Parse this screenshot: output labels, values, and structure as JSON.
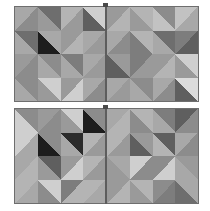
{
  "scene": {
    "title": "Geometric diagonal tile panels",
    "description": "Four square panels arranged two by two, each divided into a four by four grid of square tiles split along a diagonal into two grayscale triangles",
    "background_color": "#ffffff",
    "panel_border_color": "#6e6e6e",
    "seam_color": "#5d5d5d",
    "grid_rows": 4,
    "grid_cols": 4,
    "panel_count": 4
  },
  "palette": {
    "black": "#1d1d1d",
    "near_black": "#2b2b2b",
    "very_dark": "#4a4a4a",
    "dark": "#5f5f5f",
    "dark_mid": "#6e6e6e",
    "mid_dark": "#7d7d7d",
    "mid": "#8c8c8c",
    "mid_light": "#9a9a9a",
    "light_mid": "#a8a8a8",
    "light": "#b4b4b4",
    "lighter": "#c2c2c2",
    "pale": "#cfcfcf",
    "very_pale": "#dcdcdc",
    "near_white": "#e6e6e6"
  },
  "panels": [
    {
      "name": "top-left-panel",
      "position": "top-left",
      "x": 14,
      "y": 6,
      "w": 93,
      "h": 96,
      "tiles": [
        {
          "diagonal": "tlbr",
          "a": "#a8a8a8",
          "b": "#8c8c8c"
        },
        {
          "diagonal": "trbl",
          "a": "#6e6e6e",
          "b": "#9a9a9a"
        },
        {
          "diagonal": "tlbr",
          "a": "#b4b4b4",
          "b": "#9a9a9a"
        },
        {
          "diagonal": "trbl",
          "a": "#cfcfcf",
          "b": "#5f5f5f"
        },
        {
          "diagonal": "trbl",
          "a": "#6e6e6e",
          "b": "#a8a8a8"
        },
        {
          "diagonal": "trbl",
          "a": "#a8a8a8",
          "b": "#1d1d1d"
        },
        {
          "diagonal": "tlbr",
          "a": "#9a9a9a",
          "b": "#b4b4b4"
        },
        {
          "diagonal": "tlbr",
          "a": "#a8a8a8",
          "b": "#9a9a9a"
        },
        {
          "diagonal": "tlbr",
          "a": "#9a9a9a",
          "b": "#8c8c8c"
        },
        {
          "diagonal": "trbl",
          "a": "#8c8c8c",
          "b": "#a8a8a8"
        },
        {
          "diagonal": "trbl",
          "a": "#7d7d7d",
          "b": "#a8a8a8"
        },
        {
          "diagonal": "tlbr",
          "a": "#a8a8a8",
          "b": "#9a9a9a"
        },
        {
          "diagonal": "trbl",
          "a": "#8c8c8c",
          "b": "#a8a8a8"
        },
        {
          "diagonal": "trbl",
          "a": "#cfcfcf",
          "b": "#9a9a9a"
        },
        {
          "diagonal": "tlbr",
          "a": "#9a9a9a",
          "b": "#cfcfcf"
        },
        {
          "diagonal": "tlbr",
          "a": "#a8a8a8",
          "b": "#8c8c8c"
        }
      ]
    },
    {
      "name": "top-right-panel",
      "position": "top-right",
      "x": 106,
      "y": 6,
      "w": 93,
      "h": 96,
      "tiles": [
        {
          "diagonal": "tlbr",
          "a": "#9a9a9a",
          "b": "#b4b4b4"
        },
        {
          "diagonal": "trbl",
          "a": "#b4b4b4",
          "b": "#9a9a9a"
        },
        {
          "diagonal": "trbl",
          "a": "#8c8c8c",
          "b": "#c2c2c2"
        },
        {
          "diagonal": "tlbr",
          "a": "#c2c2c2",
          "b": "#a8a8a8"
        },
        {
          "diagonal": "tlbr",
          "a": "#a8a8a8",
          "b": "#8c8c8c"
        },
        {
          "diagonal": "trbl",
          "a": "#b4b4b4",
          "b": "#7d7d7d"
        },
        {
          "diagonal": "trbl",
          "a": "#6e6e6e",
          "b": "#a8a8a8"
        },
        {
          "diagonal": "tlbr",
          "a": "#7d7d7d",
          "b": "#5f5f5f"
        },
        {
          "diagonal": "trbl",
          "a": "#9a9a9a",
          "b": "#5f5f5f"
        },
        {
          "diagonal": "tlbr",
          "a": "#7d7d7d",
          "b": "#9a9a9a"
        },
        {
          "diagonal": "tlbr",
          "a": "#9a9a9a",
          "b": "#b4b4b4"
        },
        {
          "diagonal": "trbl",
          "a": "#cfcfcf",
          "b": "#9a9a9a"
        },
        {
          "diagonal": "tlbr",
          "a": "#a8a8a8",
          "b": "#9a9a9a"
        },
        {
          "diagonal": "trbl",
          "a": "#8c8c8c",
          "b": "#a8a8a8"
        },
        {
          "diagonal": "tlbr",
          "a": "#a8a8a8",
          "b": "#8c8c8c"
        },
        {
          "diagonal": "trbl",
          "a": "#dcdcdc",
          "b": "#5f5f5f"
        }
      ]
    },
    {
      "name": "bottom-left-panel",
      "position": "bottom-left",
      "x": 14,
      "y": 108,
      "w": 93,
      "h": 96,
      "tiles": [
        {
          "diagonal": "trbl",
          "a": "#8c8c8c",
          "b": "#cfcfcf"
        },
        {
          "diagonal": "tlbr",
          "a": "#9a9a9a",
          "b": "#8c8c8c"
        },
        {
          "diagonal": "trbl",
          "a": "#cfcfcf",
          "b": "#9a9a9a"
        },
        {
          "diagonal": "trbl",
          "a": "#8c8c8c",
          "b": "#1d1d1d"
        },
        {
          "diagonal": "tlbr",
          "a": "#cfcfcf",
          "b": "#a8a8a8"
        },
        {
          "diagonal": "trbl",
          "a": "#8c8c8c",
          "b": "#1d1d1d"
        },
        {
          "diagonal": "trbl",
          "a": "#2b2b2b",
          "b": "#a8a8a8"
        },
        {
          "diagonal": "tlbr",
          "a": "#b4b4b4",
          "b": "#9a9a9a"
        },
        {
          "diagonal": "tlbr",
          "a": "#a8a8a8",
          "b": "#b4b4b4"
        },
        {
          "diagonal": "trbl",
          "a": "#5f5f5f",
          "b": "#9a9a9a"
        },
        {
          "diagonal": "tlbr",
          "a": "#9a9a9a",
          "b": "#cfcfcf"
        },
        {
          "diagonal": "tlbr",
          "a": "#b4b4b4",
          "b": "#9a9a9a"
        },
        {
          "diagonal": "tlbr",
          "a": "#b4b4b4",
          "b": "#a8a8a8"
        },
        {
          "diagonal": "trbl",
          "a": "#cfcfcf",
          "b": "#8c8c8c"
        },
        {
          "diagonal": "tlbr",
          "a": "#7d7d7d",
          "b": "#b4b4b4"
        },
        {
          "diagonal": "tlbr",
          "a": "#b4b4b4",
          "b": "#a8a8a8"
        }
      ]
    },
    {
      "name": "bottom-right-panel",
      "position": "bottom-right",
      "x": 106,
      "y": 108,
      "w": 93,
      "h": 96,
      "tiles": [
        {
          "diagonal": "tlbr",
          "a": "#a8a8a8",
          "b": "#b4b4b4"
        },
        {
          "diagonal": "trbl",
          "a": "#b4b4b4",
          "b": "#8c8c8c"
        },
        {
          "diagonal": "trbl",
          "a": "#7d7d7d",
          "b": "#a8a8a8"
        },
        {
          "diagonal": "tlbr",
          "a": "#5f5f5f",
          "b": "#8c8c8c"
        },
        {
          "diagonal": "tlbr",
          "a": "#b4b4b4",
          "b": "#9a9a9a"
        },
        {
          "diagonal": "trbl",
          "a": "#9a9a9a",
          "b": "#5f5f5f"
        },
        {
          "diagonal": "trbl",
          "a": "#5f5f5f",
          "b": "#b4b4b4"
        },
        {
          "diagonal": "tlbr",
          "a": "#a8a8a8",
          "b": "#8c8c8c"
        },
        {
          "diagonal": "trbl",
          "a": "#a8a8a8",
          "b": "#9a9a9a"
        },
        {
          "diagonal": "tlbr",
          "a": "#cfcfcf",
          "b": "#8c8c8c"
        },
        {
          "diagonal": "tlbr",
          "a": "#8c8c8c",
          "b": "#cfcfcf"
        },
        {
          "diagonal": "trbl",
          "a": "#9a9a9a",
          "b": "#a8a8a8"
        },
        {
          "diagonal": "tlbr",
          "a": "#9a9a9a",
          "b": "#b4b4b4"
        },
        {
          "diagonal": "trbl",
          "a": "#b4b4b4",
          "b": "#9a9a9a"
        },
        {
          "diagonal": "tlbr",
          "a": "#8c8c8c",
          "b": "#7d7d7d"
        },
        {
          "diagonal": "trbl",
          "a": "#a8a8a8",
          "b": "#6e6e6e"
        }
      ]
    }
  ],
  "seams": [
    {
      "name": "top-vertical-seam",
      "x": 105,
      "y": 6,
      "w": 2,
      "h": 96
    },
    {
      "name": "bottom-vertical-seam",
      "x": 105,
      "y": 108,
      "w": 2,
      "h": 96
    }
  ],
  "nubs": [
    {
      "name": "top-seam-nub",
      "x": 103,
      "y": 3,
      "w": 5,
      "h": 4
    },
    {
      "name": "bottom-seam-nub",
      "x": 103,
      "y": 105,
      "w": 5,
      "h": 4
    }
  ]
}
